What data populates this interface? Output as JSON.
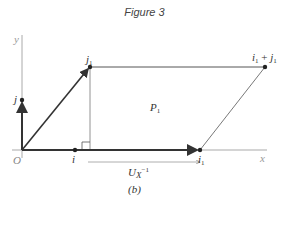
{
  "figure": {
    "title": "Figure 3",
    "caption": "(b)"
  },
  "labels": {
    "y_axis": "y",
    "x_axis": "x",
    "origin": "O",
    "j": "j",
    "i": "i",
    "j1_base": "j",
    "j1_sub": "1",
    "i1_base": "i",
    "i1_sub": "1",
    "sum_i_base": "i",
    "sum_i_sub": "1",
    "sum_plus": " + ",
    "sum_j_base": "j",
    "sum_j_sub": "1",
    "region_base": "P",
    "region_sub": "1",
    "transform_base": "U",
    "transform_sub": "X",
    "transform_sup": "−1"
  },
  "points": {
    "origin": [
      22,
      150
    ],
    "j": [
      22,
      100
    ],
    "i": [
      75,
      150
    ],
    "j1": [
      90,
      67
    ],
    "i1": [
      200,
      150
    ],
    "i1_plus_j1": [
      265,
      67
    ]
  },
  "colors": {
    "axis": "#aaaaaa",
    "vector": "#333333",
    "outline": "#555555",
    "text": "#333333"
  }
}
